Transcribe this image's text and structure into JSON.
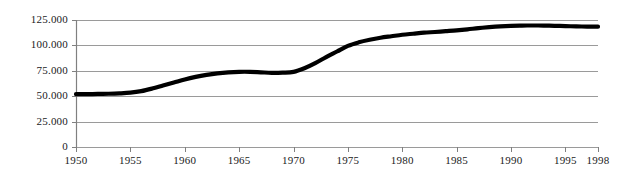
{
  "chart_data": {
    "type": "line",
    "title": "",
    "subtitle": "",
    "xlabel": "",
    "ylabel": "",
    "xlim": [
      1950,
      1998
    ],
    "ylim": [
      0,
      125000
    ],
    "grid": true,
    "legend": false,
    "legend_position": "none",
    "line_color": "#000000",
    "grid_color": "#9a9a9a",
    "axis_color": "#808080",
    "y_ticks": [
      0,
      25000,
      50000,
      75000,
      100000,
      125000
    ],
    "y_tick_labels": [
      "0",
      "25.000",
      "50.000",
      "75.000",
      "100.000",
      "125.000"
    ],
    "x_ticks": [
      1950,
      1955,
      1960,
      1965,
      1970,
      1975,
      1980,
      1985,
      1990,
      1995,
      1998
    ],
    "x_tick_labels": [
      "1950",
      "1955",
      "1960",
      "1965",
      "1970",
      "1975",
      "1980",
      "1985",
      "1990",
      "1995",
      "1998"
    ],
    "series": [
      {
        "name": "series-1",
        "x": [
          1950,
          1951,
          1952,
          1953,
          1954,
          1955,
          1956,
          1957,
          1958,
          1959,
          1960,
          1961,
          1962,
          1963,
          1964,
          1965,
          1966,
          1967,
          1968,
          1969,
          1970,
          1971,
          1972,
          1973,
          1974,
          1975,
          1976,
          1977,
          1978,
          1979,
          1980,
          1981,
          1982,
          1983,
          1984,
          1985,
          1986,
          1987,
          1988,
          1989,
          1990,
          1991,
          1992,
          1993,
          1994,
          1995,
          1996,
          1997,
          1998
        ],
        "values": [
          52000,
          52000,
          52200,
          52400,
          52800,
          53500,
          55000,
          57500,
          60500,
          63500,
          66500,
          69000,
          71000,
          72500,
          73500,
          74000,
          74000,
          73500,
          73000,
          73200,
          74000,
          77500,
          82500,
          88500,
          94000,
          99500,
          103000,
          105500,
          107500,
          109000,
          110500,
          111500,
          112500,
          113200,
          114000,
          114800,
          115800,
          117000,
          118000,
          118800,
          119300,
          119500,
          119600,
          119500,
          119300,
          119000,
          118700,
          118500,
          118400
        ]
      }
    ]
  }
}
